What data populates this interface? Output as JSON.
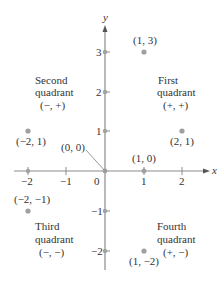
{
  "diagram": {
    "type": "coordinate-plane",
    "colors": {
      "axis": "#8c8c8c",
      "point": "#a0a0a0",
      "text": "#333333"
    },
    "axes": {
      "x_label": "x",
      "y_label": "y",
      "origin_label": "0",
      "x_ticks": [
        {
          "value": -2,
          "label": "−2"
        },
        {
          "value": -1,
          "label": "−1"
        },
        {
          "value": 1,
          "label": "1"
        },
        {
          "value": 2,
          "label": "2"
        }
      ],
      "y_ticks": [
        {
          "value": 3,
          "label": "3"
        },
        {
          "value": 2,
          "label": "2"
        },
        {
          "value": 1,
          "label": "1"
        },
        {
          "value": -1,
          "label": "−1"
        },
        {
          "value": -2,
          "label": "−2"
        }
      ]
    },
    "quadrants": {
      "first": {
        "line1": "First",
        "line2": "quadrant",
        "signs": "(+, +)"
      },
      "second": {
        "line1": "Second",
        "line2": "quadrant",
        "signs": "(−, +)"
      },
      "third": {
        "line1": "Third",
        "line2": "quadrant",
        "signs": "(−, −)"
      },
      "fourth": {
        "line1": "Fourth",
        "line2": "quadrant",
        "signs": "(+, −)"
      }
    },
    "points": [
      {
        "x": 1,
        "y": 3,
        "label": "(1, 3)"
      },
      {
        "x": -2,
        "y": 1,
        "label": "(−2, 1)"
      },
      {
        "x": 2,
        "y": 1,
        "label": "(2, 1)"
      },
      {
        "x": 0,
        "y": 0,
        "label": "(0, 0)"
      },
      {
        "x": 1,
        "y": 0,
        "label": "(1, 0)"
      },
      {
        "x": -2,
        "y": -1,
        "label": "(−2, −1)"
      },
      {
        "x": 1,
        "y": -2,
        "label": "(1, −2)"
      }
    ]
  }
}
